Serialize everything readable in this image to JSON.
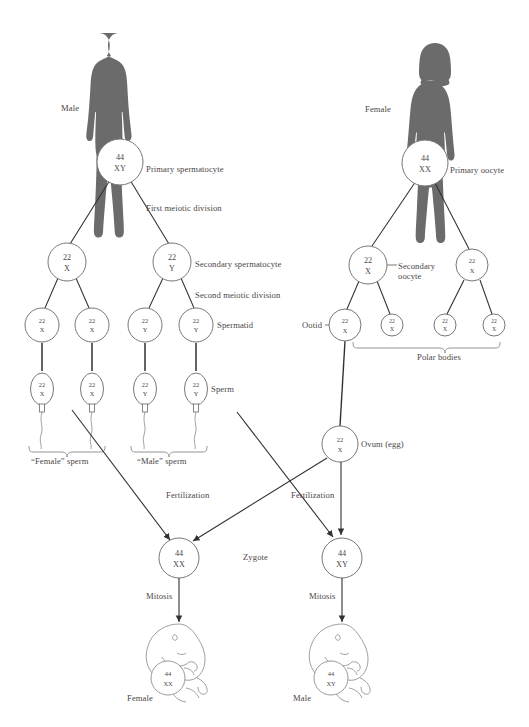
{
  "diagram": {
    "title_present": false,
    "type": "gametogenesis-fertilization-flow",
    "colors": {
      "silhouette": "#6b6b6b",
      "line": "#33312f",
      "cell_stroke": "#7a7775",
      "text": "#4a4646",
      "background": "#ffffff"
    }
  },
  "male_branch": {
    "person_label": "Male",
    "stages": [
      {
        "name": "primary-spermatocyte",
        "label": "Primary spermatocyte",
        "cells": [
          {
            "chromosomes": "44",
            "sex": "XY"
          }
        ]
      },
      {
        "name": "first-meiotic-division",
        "label": "First meiotic division",
        "cells": []
      },
      {
        "name": "secondary-spermatocyte",
        "label": "Secondary spermatocyte",
        "cells": [
          {
            "chromosomes": "22",
            "sex": "X"
          },
          {
            "chromosomes": "22",
            "sex": "Y"
          }
        ]
      },
      {
        "name": "second-meiotic-division",
        "label": "Second meiotic division",
        "cells": []
      },
      {
        "name": "spermatid",
        "label": "Spermatid",
        "cells": [
          {
            "chromosomes": "22",
            "sex": "X"
          },
          {
            "chromosomes": "22",
            "sex": "X"
          },
          {
            "chromosomes": "22",
            "sex": "Y"
          },
          {
            "chromosomes": "22",
            "sex": "Y"
          }
        ]
      },
      {
        "name": "sperm",
        "label": "Sperm",
        "cells": [
          {
            "chromosomes": "22",
            "sex": "X"
          },
          {
            "chromosomes": "22",
            "sex": "X"
          },
          {
            "chromosomes": "22",
            "sex": "Y"
          },
          {
            "chromosomes": "22",
            "sex": "Y"
          }
        ]
      }
    ],
    "brace_labels": [
      {
        "name": "female-sperm-brace",
        "label": "“Female” sperm"
      },
      {
        "name": "male-sperm-brace",
        "label": "“Male” sperm"
      }
    ]
  },
  "female_branch": {
    "person_label": "Female",
    "stages": [
      {
        "name": "primary-oocyte",
        "label": "Primary oocyte",
        "cells": [
          {
            "chromosomes": "44",
            "sex": "XX"
          }
        ]
      },
      {
        "name": "secondary-oocyte",
        "label": "Secondary oocyte",
        "cells": [
          {
            "chromosomes": "22",
            "sex": "X"
          },
          {
            "chromosomes": "22",
            "sex": "X"
          }
        ]
      },
      {
        "name": "ootid",
        "label": "Ootid",
        "cells": [
          {
            "chromosomes": "22",
            "sex": "X"
          }
        ]
      },
      {
        "name": "polar-bodies",
        "label": "Polar bodies",
        "cells": [
          {
            "chromosomes": "22",
            "sex": "X"
          },
          {
            "chromosomes": "22",
            "sex": "X"
          },
          {
            "chromosomes": "22",
            "sex": "X"
          }
        ]
      },
      {
        "name": "ovum",
        "label": "Ovum (egg)",
        "cells": [
          {
            "chromosomes": "22",
            "sex": "X"
          }
        ]
      }
    ]
  },
  "fertilization": {
    "left_label": "Fertilization",
    "right_label": "Fertilization",
    "zygote_label": "Zygote",
    "zygotes": [
      {
        "name": "zygote-female",
        "chromosomes": "44",
        "sex": "XX",
        "mitosis_label": "Mitosis",
        "offspring_label": "Female",
        "offspring_chromosomes": "44",
        "offspring_sex": "XX"
      },
      {
        "name": "zygote-male",
        "chromosomes": "44",
        "sex": "XY",
        "mitosis_label": "Mitosis",
        "offspring_label": "Male",
        "offspring_chromosomes": "44",
        "offspring_sex": "XY"
      }
    ]
  }
}
